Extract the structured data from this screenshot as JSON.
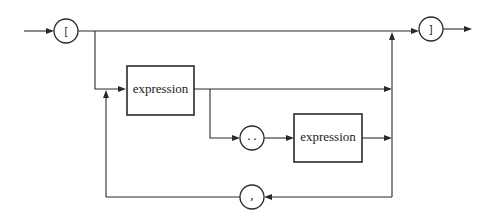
{
  "diagram": {
    "type": "syntax-railroad-diagram",
    "terminals": {
      "open_bracket": "[",
      "close_bracket": "]",
      "range_dots": "..",
      "comma": ","
    },
    "nonterminals": {
      "first_expression": "expression",
      "second_expression": "expression"
    },
    "colors": {
      "stroke": "#2a2a2a",
      "background": "#ffffff"
    }
  }
}
